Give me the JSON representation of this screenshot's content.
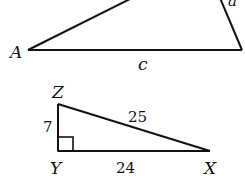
{
  "triangle_abc": {
    "vertex_a": "A",
    "side_a": "a",
    "side_c": "c"
  },
  "triangle_xyz": {
    "vertex_z": "Z",
    "vertex_y": "Y",
    "vertex_x": "X",
    "side_zy": "7",
    "side_zx": "25",
    "side_yx": "24",
    "right_angle_at": "Y"
  },
  "colors": {
    "stroke": "#111111",
    "background": "#ffffff"
  }
}
